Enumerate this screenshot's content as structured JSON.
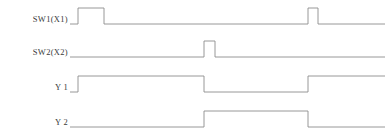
{
  "diagram": {
    "type": "timing-diagram",
    "title": "",
    "background_color": "#ffffff",
    "line_color": "#8d8d8d",
    "text_color": "#3a3a3a",
    "time_axis": {
      "start": 0,
      "end": 315,
      "unit": "px"
    },
    "signals": [
      {
        "name": "sw1",
        "label": "SW1(X1)",
        "label_top": 14,
        "row_top": 2,
        "initial_level": "low",
        "transitions": [
          {
            "x": 8,
            "level": "low"
          },
          {
            "x": 8,
            "level": "high"
          },
          {
            "x": 34,
            "level": "high"
          },
          {
            "x": 34,
            "level": "low"
          },
          {
            "x": 238,
            "level": "low"
          },
          {
            "x": 238,
            "level": "high"
          },
          {
            "x": 248,
            "level": "high"
          },
          {
            "x": 248,
            "level": "low"
          },
          {
            "x": 315,
            "level": "low"
          }
        ],
        "path": "M 0 22 L 8 22 L 8 6 L 34 6 L 34 22 L 238 22 L 238 6 L 248 6 L 248 22 L 315 22"
      },
      {
        "name": "sw2",
        "label": "SW2(X2)",
        "label_top": 47,
        "row_top": 35,
        "initial_level": "low",
        "transitions": [
          {
            "x": 134,
            "level": "low"
          },
          {
            "x": 134,
            "level": "high"
          },
          {
            "x": 145,
            "level": "high"
          },
          {
            "x": 145,
            "level": "low"
          },
          {
            "x": 315,
            "level": "low"
          }
        ],
        "path": "M 0 22 L 134 22 L 134 6 L 145 6 L 145 22 L 315 22"
      },
      {
        "name": "y1",
        "label": "Y 1",
        "label_top": 82,
        "row_top": 70,
        "initial_level": "low",
        "transitions": [
          {
            "x": 8,
            "level": "low"
          },
          {
            "x": 8,
            "level": "high"
          },
          {
            "x": 134,
            "level": "high"
          },
          {
            "x": 134,
            "level": "low"
          },
          {
            "x": 238,
            "level": "low"
          },
          {
            "x": 238,
            "level": "high"
          },
          {
            "x": 315,
            "level": "high"
          }
        ],
        "path": "M 0 22 L 8 22 L 8 6 L 134 6 L 134 22 L 238 22 L 238 6 L 315 6"
      },
      {
        "name": "y2",
        "label": "Y 2",
        "label_top": 117,
        "row_top": 105,
        "initial_level": "low",
        "transitions": [
          {
            "x": 134,
            "level": "low"
          },
          {
            "x": 134,
            "level": "high"
          },
          {
            "x": 238,
            "level": "high"
          },
          {
            "x": 238,
            "level": "low"
          },
          {
            "x": 315,
            "level": "low"
          }
        ],
        "path": "M 0 22 L 134 22 L 134 6 L 238 6 L 238 22 L 315 22"
      }
    ]
  }
}
